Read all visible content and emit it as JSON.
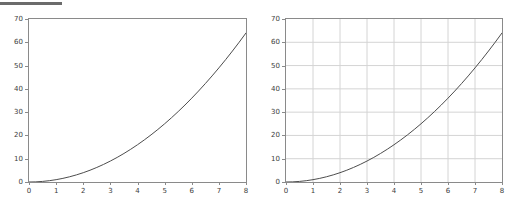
{
  "figure": {
    "background_color": "#ffffff",
    "top_rule_color": "#6b6b6b",
    "axis_color": "#8a8a8a",
    "grid_color": "#d4d4d4",
    "line_color": "#4d4d4d",
    "tick_text_color": "#3c3c3c"
  },
  "chart_data": [
    {
      "type": "line",
      "title": "",
      "subtitle": "",
      "xlabel": "",
      "ylabel": "",
      "xlim": [
        0,
        8
      ],
      "ylim": [
        0,
        70
      ],
      "grid": false,
      "legend": null,
      "xticks": [
        0,
        1,
        2,
        3,
        4,
        5,
        6,
        7,
        8
      ],
      "xticklabels": [
        "0",
        "1",
        "2",
        "3",
        "4",
        "5",
        "6",
        "7",
        "8"
      ],
      "yticks": [
        0,
        10,
        20,
        30,
        40,
        50,
        60,
        70
      ],
      "yticklabels": [
        "0",
        "10",
        "20",
        "30",
        "40",
        "50",
        "60",
        "70"
      ],
      "series": [
        {
          "name": "y = x^2",
          "color": "#4d4d4d",
          "x": [
            0,
            0.25,
            0.5,
            0.75,
            1,
            1.25,
            1.5,
            1.75,
            2,
            2.25,
            2.5,
            2.75,
            3,
            3.25,
            3.5,
            3.75,
            4,
            4.25,
            4.5,
            4.75,
            5,
            5.25,
            5.5,
            5.75,
            6,
            6.25,
            6.5,
            6.75,
            7,
            7.25,
            7.5,
            7.75,
            8
          ],
          "values": [
            0,
            0.06,
            0.25,
            0.56,
            1,
            1.56,
            2.25,
            3.06,
            4,
            5.06,
            6.25,
            7.56,
            9,
            10.56,
            12.25,
            14.06,
            16,
            18.06,
            20.25,
            22.56,
            25,
            27.56,
            30.25,
            33.06,
            36,
            39.06,
            42.25,
            45.56,
            49,
            52.56,
            56.25,
            60.06,
            64
          ]
        }
      ]
    },
    {
      "type": "line",
      "title": "",
      "subtitle": "",
      "xlabel": "",
      "ylabel": "",
      "xlim": [
        0,
        8
      ],
      "ylim": [
        0,
        70
      ],
      "grid": true,
      "legend": null,
      "xticks": [
        0,
        1,
        2,
        3,
        4,
        5,
        6,
        7,
        8
      ],
      "xticklabels": [
        "0",
        "1",
        "2",
        "3",
        "4",
        "5",
        "6",
        "7",
        "8"
      ],
      "yticks": [
        0,
        10,
        20,
        30,
        40,
        50,
        60,
        70
      ],
      "yticklabels": [
        "0",
        "10",
        "20",
        "30",
        "40",
        "50",
        "60",
        "70"
      ],
      "series": [
        {
          "name": "y = x^2",
          "color": "#4d4d4d",
          "x": [
            0,
            0.25,
            0.5,
            0.75,
            1,
            1.25,
            1.5,
            1.75,
            2,
            2.25,
            2.5,
            2.75,
            3,
            3.25,
            3.5,
            3.75,
            4,
            4.25,
            4.5,
            4.75,
            5,
            5.25,
            5.5,
            5.75,
            6,
            6.25,
            6.5,
            6.75,
            7,
            7.25,
            7.5,
            7.75,
            8
          ],
          "values": [
            0,
            0.06,
            0.25,
            0.56,
            1,
            1.56,
            2.25,
            3.06,
            4,
            5.06,
            6.25,
            7.56,
            9,
            10.56,
            12.25,
            14.06,
            16,
            18.06,
            20.25,
            22.56,
            25,
            27.56,
            30.25,
            33.06,
            36,
            39.06,
            42.25,
            45.56,
            49,
            52.56,
            56.25,
            60.06,
            64
          ]
        }
      ]
    }
  ]
}
